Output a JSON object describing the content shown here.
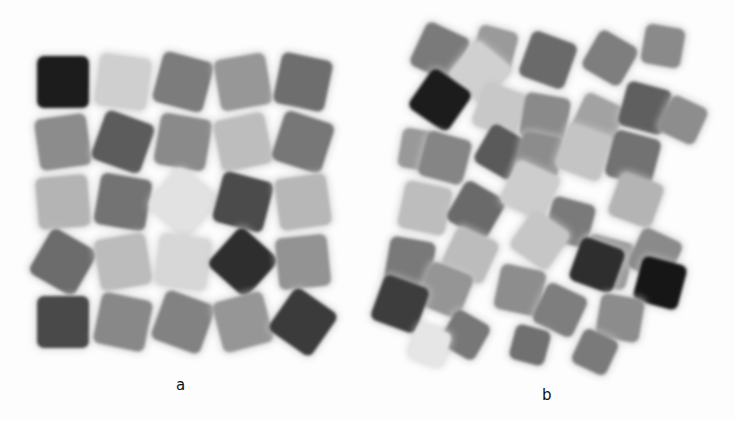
{
  "figure": {
    "panels": [
      {
        "label": "a",
        "description": "5x5 ordered grid of rotated cubes (top view)",
        "grid": {
          "rows": 5,
          "cols": 5,
          "origin": [
            63,
            82
          ],
          "pitch": [
            60,
            60
          ],
          "cells": [
            [
              "#1e1e1e",
              "#cfcfcf",
              "#7b7b7b",
              "#979797",
              "#6e6e6e"
            ],
            [
              "#8c8c8c",
              "#5c5c5c",
              "#8a8a8a",
              "#bdbdbd",
              "#777777"
            ],
            [
              "#b4b4b4",
              "#737373",
              "#e2e2e2",
              "#4c4c4c",
              "#b7b7b7"
            ],
            [
              "#6c6c6c",
              "#bcbcbc",
              "#d7d7d7",
              "#2e2e2e",
              "#939393"
            ],
            [
              "#4a4a4a",
              "#888888",
              "#828282",
              "#969696",
              "#3a3a3a"
            ]
          ],
          "rotations": [
            [
              0,
              8,
              15,
              -10,
              12
            ],
            [
              -8,
              20,
              10,
              -12,
              18
            ],
            [
              -5,
              10,
              40,
              15,
              -8
            ],
            [
              30,
              -10,
              8,
              42,
              -6
            ],
            [
              0,
              12,
              20,
              -15,
              35
            ]
          ]
        }
      },
      {
        "label": "b",
        "description": "random dense packing of rotated cubes (top view)",
        "pieces": [
          {
            "x": 440,
            "y": 52,
            "s": 48,
            "r": 25,
            "c": "#7a7a7a"
          },
          {
            "x": 495,
            "y": 48,
            "s": 40,
            "r": 15,
            "c": "#9a9a9a"
          },
          {
            "x": 548,
            "y": 60,
            "s": 48,
            "r": 20,
            "c": "#6a6a6a"
          },
          {
            "x": 610,
            "y": 58,
            "s": 44,
            "r": 30,
            "c": "#7e7e7e"
          },
          {
            "x": 663,
            "y": 46,
            "s": 40,
            "r": 10,
            "c": "#8a8a8a"
          },
          {
            "x": 480,
            "y": 72,
            "s": 48,
            "r": 40,
            "c": "#d0d0d0"
          },
          {
            "x": 440,
            "y": 100,
            "s": 48,
            "r": 35,
            "c": "#1c1c1c"
          },
          {
            "x": 500,
            "y": 110,
            "s": 46,
            "r": 20,
            "c": "#c8c8c8"
          },
          {
            "x": 545,
            "y": 118,
            "s": 46,
            "r": 10,
            "c": "#8a8a8a"
          },
          {
            "x": 598,
            "y": 120,
            "s": 44,
            "r": 25,
            "c": "#a2a2a2"
          },
          {
            "x": 645,
            "y": 108,
            "s": 46,
            "r": 15,
            "c": "#5e5e5e"
          },
          {
            "x": 683,
            "y": 120,
            "s": 40,
            "r": 25,
            "c": "#8d8d8d"
          },
          {
            "x": 420,
            "y": 150,
            "s": 40,
            "r": 10,
            "c": "#999999"
          },
          {
            "x": 445,
            "y": 158,
            "s": 46,
            "r": 15,
            "c": "#858585"
          },
          {
            "x": 502,
            "y": 152,
            "s": 44,
            "r": 30,
            "c": "#5a5a5a"
          },
          {
            "x": 540,
            "y": 155,
            "s": 42,
            "r": 12,
            "c": "#8c8c8c"
          },
          {
            "x": 584,
            "y": 152,
            "s": 48,
            "r": 20,
            "c": "#c4c4c4"
          },
          {
            "x": 633,
            "y": 158,
            "s": 48,
            "r": 15,
            "c": "#727272"
          },
          {
            "x": 425,
            "y": 208,
            "s": 48,
            "r": 12,
            "c": "#bdbdbd"
          },
          {
            "x": 476,
            "y": 210,
            "s": 46,
            "r": 30,
            "c": "#6b6b6b"
          },
          {
            "x": 530,
            "y": 190,
            "s": 48,
            "r": 25,
            "c": "#cdcdcd"
          },
          {
            "x": 570,
            "y": 222,
            "s": 44,
            "r": 15,
            "c": "#7a7a7a"
          },
          {
            "x": 636,
            "y": 200,
            "s": 46,
            "r": 20,
            "c": "#b4b4b4"
          },
          {
            "x": 540,
            "y": 240,
            "s": 46,
            "r": 35,
            "c": "#c6c6c6"
          },
          {
            "x": 410,
            "y": 262,
            "s": 46,
            "r": 10,
            "c": "#797979"
          },
          {
            "x": 470,
            "y": 255,
            "s": 46,
            "r": 25,
            "c": "#bcbcbc"
          },
          {
            "x": 607,
            "y": 262,
            "s": 48,
            "r": 15,
            "c": "#9a9a9a"
          },
          {
            "x": 655,
            "y": 255,
            "s": 44,
            "r": 25,
            "c": "#8a8a8a"
          },
          {
            "x": 520,
            "y": 290,
            "s": 46,
            "r": 12,
            "c": "#8d8d8d"
          },
          {
            "x": 445,
            "y": 290,
            "s": 46,
            "r": 22,
            "c": "#959595"
          },
          {
            "x": 597,
            "y": 265,
            "s": 46,
            "r": 20,
            "c": "#2e2e2e"
          },
          {
            "x": 660,
            "y": 283,
            "s": 46,
            "r": 15,
            "c": "#141414"
          },
          {
            "x": 400,
            "y": 304,
            "s": 48,
            "r": 20,
            "c": "#3c3c3c"
          },
          {
            "x": 560,
            "y": 310,
            "s": 44,
            "r": 25,
            "c": "#7e7e7e"
          },
          {
            "x": 620,
            "y": 318,
            "s": 44,
            "r": 10,
            "c": "#8c8c8c"
          },
          {
            "x": 465,
            "y": 335,
            "s": 40,
            "r": 30,
            "c": "#777777"
          },
          {
            "x": 530,
            "y": 345,
            "s": 36,
            "r": 15,
            "c": "#6f6f6f"
          },
          {
            "x": 595,
            "y": 352,
            "s": 38,
            "r": 25,
            "c": "#7a7a7a"
          },
          {
            "x": 430,
            "y": 345,
            "s": 36,
            "r": 20,
            "c": "#e6e6e6"
          }
        ]
      }
    ]
  }
}
